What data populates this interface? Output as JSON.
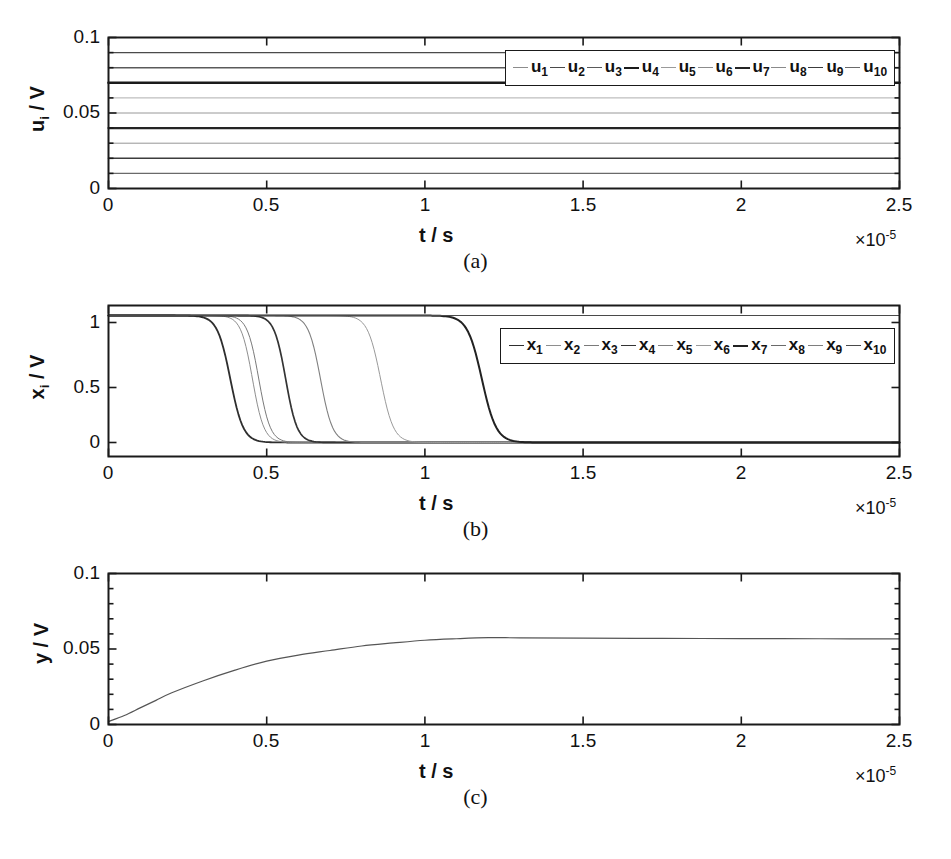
{
  "figure": {
    "panels": [
      {
        "id": "a",
        "caption": "(a)",
        "xlabel": "t / s",
        "ylabel_main": "u",
        "ylabel_sub": "i",
        "ylabel_unit": "/ V",
        "exponent_prefix": "×10",
        "exponent_power": "-5",
        "xticks": [
          "0",
          "0.5",
          "1",
          "1.5",
          "2",
          "2.5"
        ],
        "yticks": [
          "0",
          "0.05",
          "0.1"
        ]
      },
      {
        "id": "b",
        "caption": "(b)",
        "xlabel": "t / s",
        "ylabel_main": "x",
        "ylabel_sub": "i",
        "ylabel_unit": "/ V",
        "exponent_prefix": "×10",
        "exponent_power": "-5",
        "xticks": [
          "0",
          "0.5",
          "1",
          "1.5",
          "2",
          "2.5"
        ],
        "yticks": [
          "0",
          "0.5",
          "1"
        ]
      },
      {
        "id": "c",
        "caption": "(c)",
        "xlabel": "t / s",
        "ylabel_main": "y",
        "ylabel_sub": "",
        "ylabel_unit": "/ V",
        "exponent_prefix": "×10",
        "exponent_power": "-5",
        "xticks": [
          "0",
          "0.5",
          "1",
          "1.5",
          "2",
          "2.5"
        ],
        "yticks": [
          "0",
          "0.05",
          "0.1"
        ]
      }
    ]
  },
  "legend_a": {
    "entries": [
      {
        "label": "u",
        "sub": "1"
      },
      {
        "label": "u",
        "sub": "2"
      },
      {
        "label": "u",
        "sub": "3"
      },
      {
        "label": "u",
        "sub": "4"
      },
      {
        "label": "u",
        "sub": "5"
      },
      {
        "label": "u",
        "sub": "6"
      },
      {
        "label": "u",
        "sub": "7"
      },
      {
        "label": "u",
        "sub": "8"
      },
      {
        "label": "u",
        "sub": "9"
      },
      {
        "label": "u",
        "sub": "10"
      }
    ]
  },
  "legend_b": {
    "entries": [
      {
        "label": "x",
        "sub": "1"
      },
      {
        "label": "x",
        "sub": "2"
      },
      {
        "label": "x",
        "sub": "3"
      },
      {
        "label": "x",
        "sub": "4"
      },
      {
        "label": "x",
        "sub": "5"
      },
      {
        "label": "x",
        "sub": "6"
      },
      {
        "label": "x",
        "sub": "7"
      },
      {
        "label": "x",
        "sub": "8"
      },
      {
        "label": "x",
        "sub": "9"
      },
      {
        "label": "x",
        "sub": "10"
      }
    ]
  },
  "chart_data": [
    {
      "type": "line",
      "panel": "a",
      "title": "",
      "xlabel": "t / s",
      "ylabel": "u_i / V",
      "x_exponent": -5,
      "xlim": [
        0,
        2.5
      ],
      "ylim": [
        0,
        0.1
      ],
      "xticks": [
        0,
        0.5,
        1,
        1.5,
        2,
        2.5
      ],
      "yticks": [
        0,
        0.05,
        0.1
      ],
      "grid": false,
      "legend_position": "top-right-inside",
      "note": "Ten constant DC input voltages, evenly spaced by 0.01 V",
      "series": [
        {
          "name": "u_1",
          "constant_value": 0.1,
          "width": 0.8,
          "gray": "#8c8c8c"
        },
        {
          "name": "u_2",
          "constant_value": 0.09,
          "width": 1.4,
          "gray": "#4a4a4a"
        },
        {
          "name": "u_3",
          "constant_value": 0.08,
          "width": 1.4,
          "gray": "#5a5a5a"
        },
        {
          "name": "u_4",
          "constant_value": 0.07,
          "width": 2.6,
          "gray": "#1a1a1a"
        },
        {
          "name": "u_5",
          "constant_value": 0.06,
          "width": 0.8,
          "gray": "#9a9a9a"
        },
        {
          "name": "u_6",
          "constant_value": 0.05,
          "width": 0.9,
          "gray": "#8c8c8c"
        },
        {
          "name": "u_7",
          "constant_value": 0.04,
          "width": 2.2,
          "gray": "#242424"
        },
        {
          "name": "u_8",
          "constant_value": 0.03,
          "width": 0.9,
          "gray": "#8a8a8a"
        },
        {
          "name": "u_9",
          "constant_value": 0.02,
          "width": 1.6,
          "gray": "#3c3c3c"
        },
        {
          "name": "u_10",
          "constant_value": 0.01,
          "width": 1.2,
          "gray": "#6a6a6a"
        }
      ]
    },
    {
      "type": "line",
      "panel": "b",
      "title": "",
      "xlabel": "t / s",
      "ylabel": "x_i / V",
      "x_exponent": -5,
      "xlim": [
        0,
        2.5
      ],
      "ylim": [
        0,
        1.08
      ],
      "xticks": [
        0,
        0.5,
        1,
        1.5,
        2,
        2.5
      ],
      "yticks": [
        0,
        0.5,
        1
      ],
      "grid": false,
      "legend_position": "top-right-inside",
      "note": "Ten state signals start near 1 V and fall to ~0 V at staggered switching times",
      "series": [
        {
          "name": "x_1",
          "start_value": 1.0,
          "end_value": 0.0,
          "fall_time": 0.385,
          "fall_width": 0.045,
          "width": 1.8,
          "gray": "#2e2e2e"
        },
        {
          "name": "x_2",
          "start_value": 1.0,
          "end_value": 0.0,
          "fall_time": 0.455,
          "fall_width": 0.04,
          "width": 1.0,
          "gray": "#8e8e8e"
        },
        {
          "name": "x_3",
          "start_value": 1.0,
          "end_value": 0.0,
          "fall_time": 0.475,
          "fall_width": 0.04,
          "width": 1.0,
          "gray": "#7a7a7a"
        },
        {
          "name": "x_4",
          "start_value": 1.0,
          "end_value": 0.0,
          "fall_time": 0.56,
          "fall_width": 0.04,
          "width": 1.7,
          "gray": "#343434"
        },
        {
          "name": "x_5",
          "start_value": 1.0,
          "end_value": 0.0,
          "fall_time": 0.67,
          "fall_width": 0.042,
          "width": 1.1,
          "gray": "#808080"
        },
        {
          "name": "x_6",
          "start_value": 1.0,
          "end_value": 0.0,
          "fall_time": 0.86,
          "fall_width": 0.045,
          "width": 1.0,
          "gray": "#9a9a9a"
        },
        {
          "name": "x_7",
          "start_value": 1.0,
          "end_value": 0.0,
          "fall_time": 1.18,
          "fall_width": 0.05,
          "width": 2.0,
          "gray": "#222222"
        },
        {
          "name": "x_8",
          "start_value": 1.0,
          "end_value": 1.0,
          "fall_time": null,
          "fall_width": 0,
          "width": 1.0,
          "gray": "#6a6a6a"
        },
        {
          "name": "x_9",
          "start_value": 1.0,
          "end_value": 1.0,
          "fall_time": null,
          "fall_width": 0,
          "width": 1.0,
          "gray": "#7e7e7e"
        },
        {
          "name": "x_10",
          "start_value": 1.0,
          "end_value": 1.0,
          "fall_time": null,
          "fall_width": 0,
          "width": 1.2,
          "gray": "#4a4a4a"
        }
      ]
    },
    {
      "type": "line",
      "panel": "c",
      "title": "",
      "xlabel": "t / s",
      "ylabel": "y / V",
      "x_exponent": -5,
      "xlim": [
        0,
        2.5
      ],
      "ylim": [
        0,
        0.1
      ],
      "xticks": [
        0,
        0.5,
        1,
        1.5,
        2,
        2.5
      ],
      "yticks": [
        0,
        0.05,
        0.1
      ],
      "grid": false,
      "legend_position": "none",
      "note": "Output voltage rises and saturates near 0.057 V",
      "series": [
        {
          "name": "y",
          "width": 1.2,
          "gray": "#555555",
          "x": [
            0,
            0.05,
            0.1,
            0.15,
            0.2,
            0.3,
            0.4,
            0.5,
            0.6,
            0.7,
            0.8,
            0.9,
            1.0,
            1.1,
            1.2,
            1.3,
            1.5,
            1.75,
            2.0,
            2.25,
            2.5
          ],
          "y": [
            0.002,
            0.006,
            0.011,
            0.016,
            0.021,
            0.029,
            0.036,
            0.042,
            0.046,
            0.049,
            0.052,
            0.054,
            0.0558,
            0.0568,
            0.0575,
            0.0574,
            0.0572,
            0.057,
            0.0569,
            0.0568,
            0.0567
          ]
        }
      ]
    }
  ]
}
